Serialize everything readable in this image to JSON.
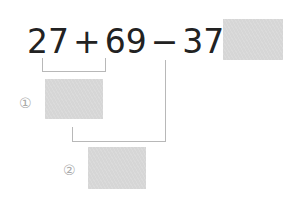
{
  "equation": {
    "terms": [
      "27",
      "+",
      "69",
      "−",
      "37",
      "="
    ],
    "text": "27 + 69 − 37 ="
  },
  "steps": [
    {
      "label": "①",
      "description": "27 + 69"
    },
    {
      "label": "②",
      "description": "result ① − 37"
    }
  ],
  "colors": {
    "box": "#d6d6d6",
    "line": "#b8b8b8",
    "text": "#222222"
  }
}
